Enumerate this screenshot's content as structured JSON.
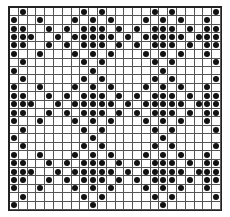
{
  "grid": {
    "rows": 24,
    "cols": 24,
    "dot_color": "#111111",
    "line_color": "#555555",
    "filled": [
      [
        1,
        8,
        10,
        16,
        18,
        23
      ],
      [
        0,
        3,
        7,
        9,
        11,
        15,
        17,
        19,
        22
      ],
      [
        0,
        1,
        4,
        6,
        8,
        9,
        10,
        12,
        14,
        16,
        17,
        18,
        20,
        22,
        23
      ],
      [
        0,
        1,
        2,
        5,
        7,
        8,
        9,
        10,
        11,
        13,
        15,
        16,
        17,
        18,
        19,
        21,
        22,
        23
      ],
      [
        0,
        1,
        4,
        6,
        8,
        9,
        10,
        12,
        14,
        16,
        17,
        18,
        20,
        22,
        23
      ],
      [
        0,
        3,
        7,
        9,
        11,
        15,
        17,
        19,
        22
      ],
      [
        1,
        8,
        10,
        16,
        18,
        23
      ],
      [
        0,
        9,
        17
      ],
      [
        1,
        8,
        10,
        16,
        18,
        23
      ],
      [
        0,
        3,
        7,
        9,
        11,
        15,
        17,
        19,
        22
      ],
      [
        0,
        1,
        4,
        6,
        8,
        9,
        10,
        12,
        14,
        16,
        17,
        18,
        20,
        22,
        23
      ],
      [
        0,
        1,
        2,
        5,
        7,
        8,
        9,
        10,
        11,
        13,
        15,
        16,
        17,
        18,
        19,
        21,
        22,
        23
      ],
      [
        0,
        1,
        4,
        6,
        8,
        9,
        10,
        12,
        14,
        16,
        17,
        18,
        20,
        22,
        23
      ],
      [
        0,
        3,
        7,
        9,
        11,
        15,
        17,
        19,
        22
      ],
      [
        1,
        8,
        10,
        16,
        18,
        23
      ],
      [
        0,
        9,
        17
      ],
      [
        1,
        8,
        10,
        16,
        18,
        23
      ],
      [
        0,
        3,
        7,
        9,
        11,
        15,
        17,
        19,
        22
      ],
      [
        0,
        1,
        4,
        6,
        8,
        9,
        10,
        12,
        14,
        16,
        17,
        18,
        20,
        22,
        23
      ],
      [
        0,
        1,
        2,
        5,
        7,
        8,
        9,
        10,
        11,
        13,
        15,
        16,
        17,
        18,
        19,
        21,
        22,
        23
      ],
      [
        0,
        1,
        4,
        6,
        8,
        9,
        10,
        12,
        14,
        16,
        17,
        18,
        20,
        22,
        23
      ],
      [
        0,
        3,
        7,
        9,
        11,
        15,
        17,
        19,
        22
      ],
      [
        1,
        8,
        10,
        16,
        18,
        23
      ],
      [
        0,
        9,
        17
      ]
    ]
  }
}
